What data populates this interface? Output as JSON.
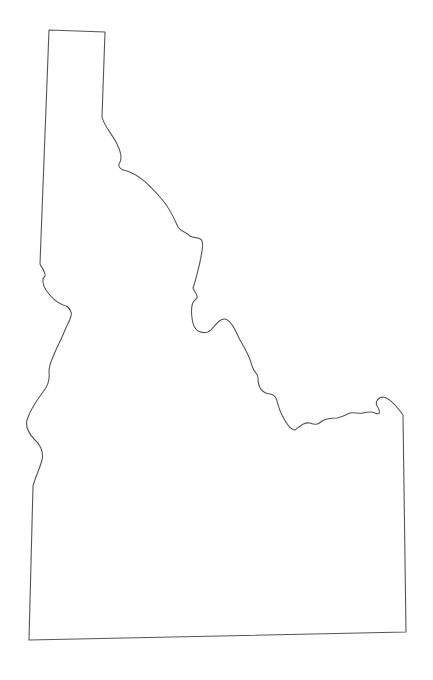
{
  "map": {
    "type": "outline",
    "region": "Idaho",
    "stroke_color": "#555555",
    "fill_color": "#ffffff",
    "background_color": "#ffffff",
    "labels": []
  }
}
